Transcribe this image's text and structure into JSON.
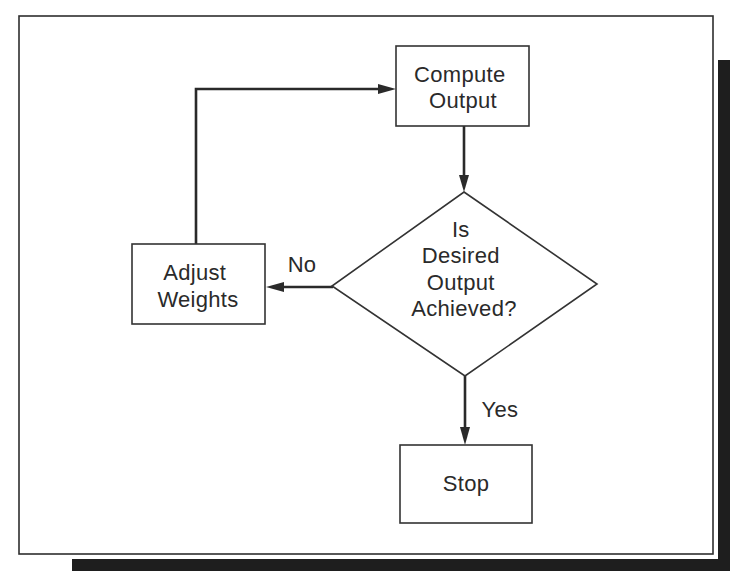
{
  "diagram": {
    "type": "flowchart",
    "nodes": {
      "compute_output": {
        "shape": "rectangle",
        "lines": [
          "Compute",
          "Output"
        ]
      },
      "decision": {
        "shape": "diamond",
        "lines": [
          "Is",
          "Desired",
          "Output",
          "Achieved?"
        ]
      },
      "adjust_weights": {
        "shape": "rectangle",
        "lines": [
          "Adjust",
          "Weights"
        ]
      },
      "stop": {
        "shape": "rectangle",
        "lines": [
          "Stop"
        ]
      }
    },
    "edges": [
      {
        "from": "Compute Output",
        "to": "Is Desired Output Achieved?",
        "label": ""
      },
      {
        "from": "Is Desired Output Achieved?",
        "to": "Adjust Weights",
        "label": "No"
      },
      {
        "from": "Adjust Weights",
        "to": "Compute Output",
        "label": ""
      },
      {
        "from": "Is Desired Output Achieved?",
        "to": "Stop",
        "label": "Yes"
      }
    ]
  },
  "colors": {
    "ink": "#2a2a2a",
    "shadow": "#1e1e1e",
    "background": "#ffffff"
  }
}
